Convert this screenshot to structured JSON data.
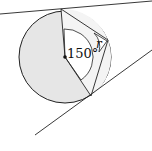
{
  "diagram": {
    "angle_label": "150°",
    "radius_label": "r",
    "colors": {
      "shade": "#e6e6e6",
      "stroke": "#222222",
      "background": "#ffffff"
    }
  }
}
